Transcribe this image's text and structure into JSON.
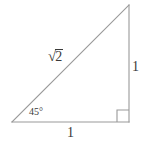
{
  "figure": {
    "kind": "right-isosceles-triangle-diagram",
    "background_color": "#ffffff",
    "stroke_color": "#999999",
    "text_color": "#3a3a3a",
    "labels": {
      "hypotenuse_radical_sign": "√",
      "hypotenuse_radicand": "2",
      "hypotenuse_full": "√2",
      "leg_vertical": "1",
      "leg_horizontal": "1",
      "angle": "45°"
    },
    "geometry": {
      "vertex_left": [
        12,
        122
      ],
      "vertex_bottom_right": [
        129,
        122
      ],
      "vertex_top": [
        129,
        5
      ],
      "right_angle_marker_size": 12
    }
  }
}
